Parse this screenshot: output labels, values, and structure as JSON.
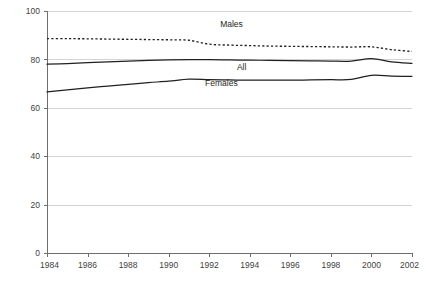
{
  "chart_data": {
    "type": "line",
    "title": "",
    "subtitle": "",
    "xlabel": "",
    "ylabel": "",
    "xlim": [
      1984,
      2002
    ],
    "ylim": [
      0,
      100
    ],
    "grid": true,
    "legend_position": "inline-labels",
    "x": [
      1984,
      1985,
      1986,
      1987,
      1988,
      1989,
      1990,
      1991,
      1992,
      1993,
      1994,
      1995,
      1996,
      1997,
      1998,
      1999,
      2000,
      2001,
      2002
    ],
    "y_ticks": [
      0,
      20,
      40,
      60,
      80,
      100
    ],
    "y_tick_labels": [
      "0",
      "20",
      "40",
      "60",
      "80",
      "100"
    ],
    "x_ticks": [
      1984,
      1986,
      1988,
      1990,
      1992,
      1994,
      1996,
      1998,
      2000,
      2002
    ],
    "x_tick_labels": [
      "1984",
      "1986",
      "1988",
      "1990",
      "1992",
      "1994",
      "1996",
      "1998",
      "2000",
      "2002"
    ],
    "series": [
      {
        "name": "Males",
        "style": "dotted",
        "label": "Males",
        "label_x": 1993.1,
        "label_y": 93.5,
        "color": "#231f20",
        "values": [
          88.6,
          88.6,
          88.5,
          88.4,
          88.3,
          88.2,
          88.1,
          87.9,
          86.3,
          85.9,
          85.7,
          85.5,
          85.4,
          85.3,
          85.2,
          85.1,
          85.2,
          84.0,
          83.3
        ]
      },
      {
        "name": "All",
        "style": "solid",
        "label": "All",
        "label_x": 1993.6,
        "label_y": 75.6,
        "color": "#231f20",
        "values": [
          78.0,
          78.3,
          78.7,
          79.0,
          79.3,
          79.6,
          79.8,
          79.9,
          79.9,
          79.8,
          79.7,
          79.6,
          79.5,
          79.4,
          79.3,
          79.3,
          80.3,
          79.0,
          78.4
        ]
      },
      {
        "name": "Females",
        "style": "solid",
        "label": "Females",
        "label_x": 1992.6,
        "label_y": 69.0,
        "color": "#231f20",
        "values": [
          66.6,
          67.4,
          68.2,
          69.0,
          69.7,
          70.4,
          71.0,
          71.8,
          71.6,
          71.5,
          71.4,
          71.4,
          71.4,
          71.5,
          71.6,
          71.7,
          73.4,
          73.1,
          73.0
        ]
      }
    ]
  }
}
